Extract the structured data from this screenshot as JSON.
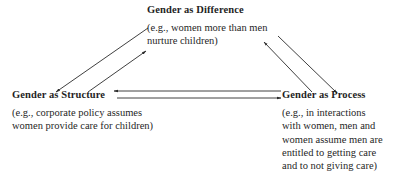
{
  "diagram": {
    "type": "triangle-relationship",
    "nodes": {
      "difference": {
        "title": "Gender as Difference",
        "example_lines": [
          "(e.g., women more than men",
          "nurture children)"
        ]
      },
      "structure": {
        "title": "Gender as Structure",
        "example_lines": [
          "(e.g., corporate policy assumes",
          "women provide care for children)"
        ]
      },
      "process": {
        "title": "Gender as Process",
        "example_lines": [
          "(e.g., in interactions",
          "with women, men and",
          "women assume men are",
          "entitled to getting care",
          "and to not giving care)"
        ]
      }
    },
    "edges": [
      {
        "from": "difference",
        "to": "structure"
      },
      {
        "from": "structure",
        "to": "difference"
      },
      {
        "from": "difference",
        "to": "process"
      },
      {
        "from": "process",
        "to": "difference"
      },
      {
        "from": "process",
        "to": "structure"
      },
      {
        "from": "structure",
        "to": "process"
      }
    ],
    "colors": {
      "text": "#1f1f1f",
      "line": "#2a2a2a",
      "background": "#ffffff"
    }
  }
}
